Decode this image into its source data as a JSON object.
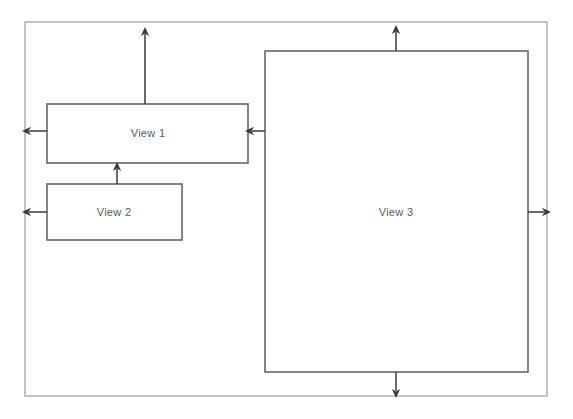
{
  "diagram": {
    "background_color": "#ffffff",
    "outer_frame": {
      "name": "outer-container",
      "x": 25,
      "y": 22,
      "width": 522,
      "height": 374,
      "stroke_color": "#b5b5b5",
      "stroke_width": 1.6,
      "label": ""
    },
    "boxes": [
      {
        "id": "view-1",
        "label": "View 1",
        "x": 47,
        "y": 104,
        "width": 201,
        "height": 59,
        "stroke_color": "#666666",
        "stroke_width": 1.6,
        "fill": "#ffffff",
        "label_x": 148,
        "label_y": 133
      },
      {
        "id": "view-2",
        "label": "View 2",
        "x": 47,
        "y": 184,
        "width": 135,
        "height": 56,
        "stroke_color": "#666666",
        "stroke_width": 1.6,
        "fill": "#ffffff",
        "label_x": 114,
        "label_y": 212
      },
      {
        "id": "view-3",
        "label": "View 3",
        "x": 265,
        "y": 51,
        "width": 263,
        "height": 321,
        "stroke_color": "#666666",
        "stroke_width": 1.6,
        "fill": "#ffffff",
        "label_x": 396,
        "label_y": 212
      }
    ],
    "arrows": [
      {
        "id": "arrow-view1-up",
        "direction": "up",
        "from_x": 145,
        "from_y": 104,
        "to_x": 145,
        "to_y": 27,
        "stroke_color": "#3a3a3a",
        "stroke_width": 1.5
      },
      {
        "id": "arrow-view1-left",
        "direction": "left",
        "from_x": 47,
        "from_y": 131,
        "to_x": 22,
        "to_y": 131,
        "stroke_color": "#3a3a3a",
        "stroke_width": 1.5
      },
      {
        "id": "arrow-view3-to-view1",
        "direction": "left",
        "from_x": 265,
        "from_y": 131,
        "to_x": 245,
        "to_y": 131,
        "stroke_color": "#3a3a3a",
        "stroke_width": 1.5
      },
      {
        "id": "arrow-view2-to-view1",
        "direction": "up",
        "from_x": 117,
        "from_y": 184,
        "to_x": 117,
        "to_y": 162,
        "stroke_color": "#3a3a3a",
        "stroke_width": 1.5
      },
      {
        "id": "arrow-view2-left",
        "direction": "left",
        "from_x": 47,
        "from_y": 212,
        "to_x": 22,
        "to_y": 212,
        "stroke_color": "#3a3a3a",
        "stroke_width": 1.5
      },
      {
        "id": "arrow-view3-up",
        "direction": "up",
        "from_x": 396,
        "from_y": 51,
        "to_x": 396,
        "to_y": 25,
        "stroke_color": "#3a3a3a",
        "stroke_width": 1.5
      },
      {
        "id": "arrow-view3-right",
        "direction": "right",
        "from_x": 528,
        "from_y": 212,
        "to_x": 551,
        "to_y": 212,
        "stroke_color": "#3a3a3a",
        "stroke_width": 1.5
      },
      {
        "id": "arrow-view3-down",
        "direction": "down",
        "from_x": 396,
        "from_y": 372,
        "to_x": 396,
        "to_y": 398,
        "stroke_color": "#3a3a3a",
        "stroke_width": 1.5
      }
    ]
  }
}
